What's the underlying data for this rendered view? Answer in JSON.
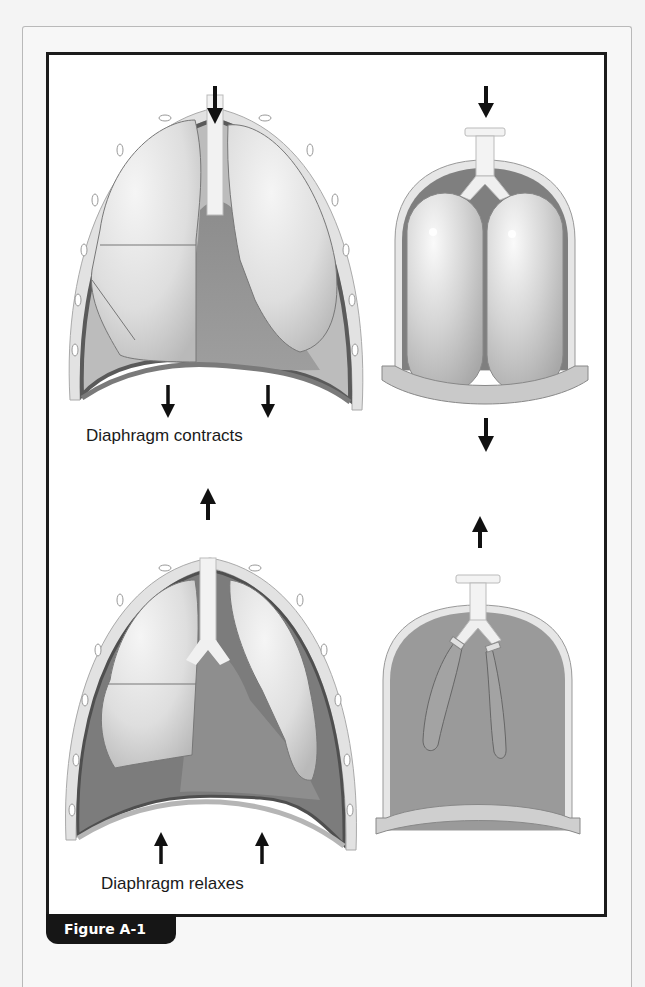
{
  "figure": {
    "caption": "Figure A-1",
    "panels": [
      {
        "id": "thorax-inhale",
        "label": "Diaphragm contracts",
        "airflow": "in",
        "diaphragm": "down"
      },
      {
        "id": "bell-jar-inhale",
        "label": "",
        "airflow": "in",
        "diaphragm": "down"
      },
      {
        "id": "thorax-exhale",
        "label": "Diaphragm relaxes",
        "airflow": "out",
        "diaphragm": "up"
      },
      {
        "id": "bell-jar-exhale",
        "label": "",
        "airflow": "out",
        "diaphragm": "up"
      }
    ]
  },
  "colors": {
    "frame": "#1c1c1c",
    "tab_bg": "#161616",
    "tab_text": "#ffffff",
    "lung": "#d9d9d9",
    "cavity": "#8a8a8a",
    "wall": "#5a5a5a"
  }
}
